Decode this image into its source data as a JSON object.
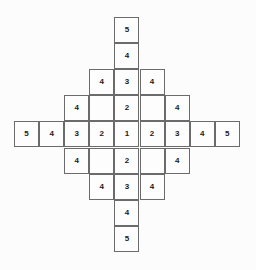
{
  "figure": {
    "name": "diamond-number-grid",
    "background_color": "#fcfcfc",
    "cell_border_color": "#6b6b6b",
    "cell_fill_color": "#fdfdfd",
    "text_color": "#1a1a1a"
  },
  "grid": {
    "columns": 9,
    "rows": 9,
    "cell_width": 25.1,
    "cell_height": 26.1,
    "origin_x": 14,
    "origin_y": 17
  },
  "chart_data": {
    "type": "heatmap",
    "title": "",
    "xlabel": "",
    "ylabel": "",
    "columns": 9,
    "rows": 9,
    "legend": [],
    "grid": true,
    "note": "null = cell not drawn; empty string = cell drawn but unlabeled",
    "values": [
      [
        null,
        null,
        null,
        null,
        "5",
        null,
        null,
        null,
        null
      ],
      [
        null,
        null,
        null,
        null,
        "4",
        null,
        null,
        null,
        null
      ],
      [
        null,
        null,
        null,
        "4",
        "3",
        "4",
        null,
        null,
        null
      ],
      [
        null,
        null,
        "4",
        "",
        "2",
        "",
        "4",
        null,
        null
      ],
      [
        "5",
        "4",
        "3",
        "2",
        "1",
        "2",
        "3",
        "4",
        "5"
      ],
      [
        null,
        null,
        "4",
        "",
        "2",
        "",
        "4",
        null,
        null
      ],
      [
        null,
        null,
        null,
        "4",
        "3",
        "4",
        null,
        null,
        null
      ],
      [
        null,
        null,
        null,
        null,
        "4",
        null,
        null,
        null,
        null
      ],
      [
        null,
        null,
        null,
        null,
        "5",
        null,
        null,
        null,
        null
      ]
    ]
  }
}
